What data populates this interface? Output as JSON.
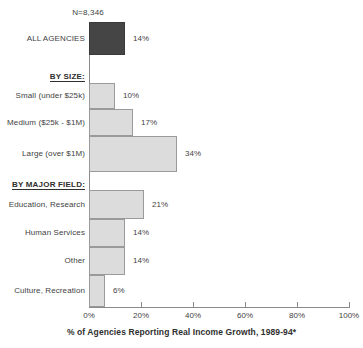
{
  "chart_data": {
    "type": "bar",
    "orientation": "horizontal",
    "title": "",
    "xlabel": "% of Agencies Reporting Real Income Growth, 1989-94*",
    "ylabel": "",
    "xlim": [
      0,
      100
    ],
    "xticks": [
      0,
      20,
      40,
      60,
      80,
      100
    ],
    "xtick_labels": [
      "0%",
      "20%",
      "40%",
      "60%",
      "80%",
      "100%"
    ],
    "grid": false,
    "legend": "none",
    "annotations": [
      "N=8,346"
    ],
    "sample_size_note": "N=8,346",
    "categories": [
      "ALL AGENCIES",
      "Small (under $25k)",
      "Medium ($25k - $1M)",
      "Large (over $1M)",
      "Education, Research",
      "Human Services",
      "Other",
      "Culture, Recreation"
    ],
    "values": [
      14,
      10,
      17,
      34,
      21,
      14,
      14,
      6
    ],
    "value_labels": [
      "14%",
      "10%",
      "17%",
      "34%",
      "21%",
      "14%",
      "14%",
      "6%"
    ],
    "group_headers": [
      "BY SIZE:",
      "BY MAJOR FIELD:"
    ],
    "series": [
      {
        "name": "% of Agencies Reporting Real Income Growth, 1989-94*",
        "values": [
          14,
          10,
          17,
          34,
          21,
          14,
          14,
          6
        ]
      }
    ],
    "bars": [
      {
        "label": "ALL AGENCIES",
        "value": 14,
        "value_label": "14%",
        "style": "dark",
        "group": "total"
      },
      {
        "label": "Small (under $25k)",
        "value": 10,
        "value_label": "10%",
        "style": "light",
        "group": "BY SIZE:"
      },
      {
        "label": "Medium ($25k - $1M)",
        "value": 17,
        "value_label": "17%",
        "style": "light",
        "group": "BY SIZE:"
      },
      {
        "label": "Large (over $1M)",
        "value": 34,
        "value_label": "34%",
        "style": "light",
        "group": "BY SIZE:"
      },
      {
        "label": "Education, Research",
        "value": 21,
        "value_label": "21%",
        "style": "light",
        "group": "BY MAJOR FIELD:"
      },
      {
        "label": "Human Services",
        "value": 14,
        "value_label": "14%",
        "style": "light",
        "group": "BY MAJOR FIELD:"
      },
      {
        "label": "Other",
        "value": 14,
        "value_label": "14%",
        "style": "light",
        "group": "BY MAJOR FIELD:"
      },
      {
        "label": "Culture, Recreation",
        "value": 6,
        "value_label": "6%",
        "style": "light",
        "group": "BY MAJOR FIELD:"
      }
    ],
    "colors": {
      "bar_dark": "#454545",
      "bar_light": "#dcdcdc",
      "bar_border": "#8d8d8d",
      "axis": "#8a8a8a",
      "text": "#3f3f3f",
      "background": "#ffffff"
    }
  },
  "geometry": {
    "x0_px": 89,
    "px_per_pct": 2.6,
    "axis_y_px": 307,
    "rows": [
      {
        "top": 22,
        "height": 33
      },
      {
        "top": 83,
        "height": 26
      },
      {
        "top": 109,
        "height": 27
      },
      {
        "top": 136,
        "height": 36
      },
      {
        "top": 190,
        "height": 29
      },
      {
        "top": 219,
        "height": 28
      },
      {
        "top": 247,
        "height": 28
      },
      {
        "top": 275,
        "height": 32
      }
    ],
    "group_header_tops": [
      72,
      180
    ]
  }
}
